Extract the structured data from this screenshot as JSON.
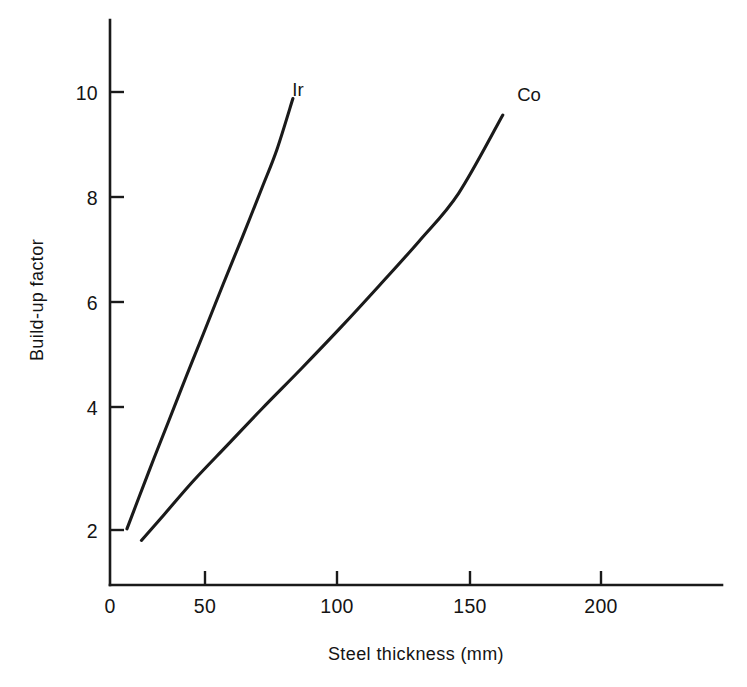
{
  "chart_data": {
    "type": "line",
    "title": "",
    "subtitle": "",
    "xlabel": "Steel thickness (mm)",
    "ylabel": "Build-up factor",
    "xlim": [
      0,
      234
    ],
    "ylim": [
      0,
      11.1
    ],
    "xticks": [
      0,
      50,
      100,
      150,
      200
    ],
    "xticklabels": [
      "0",
      "50",
      "100",
      "150",
      "200"
    ],
    "yticks": [
      2,
      4,
      6,
      8,
      10
    ],
    "yticklabels": [
      "2",
      "4",
      "6",
      "8",
      "10"
    ],
    "grid": false,
    "legend": "inline-curve-labels",
    "annotations": [
      {
        "text": "Ir",
        "x": 74,
        "y": 10.45
      },
      {
        "text": "Co",
        "x": 158,
        "y": 10.05
      }
    ],
    "series": [
      {
        "name": "Ir",
        "label": "Ir",
        "color": "#1a1a1a",
        "x": [
          6.9,
          12.0,
          18.0,
          24.0,
          31.0,
          38.0,
          46.0,
          54.0,
          62.0,
          68.0,
          74.5
        ],
        "y": [
          2.02,
          2.62,
          3.32,
          4.0,
          4.8,
          5.58,
          6.48,
          7.36,
          8.26,
          8.95,
          9.88
        ]
      },
      {
        "name": "Co",
        "label": "Co",
        "color": "#1a1a1a",
        "x": [
          12.8,
          22.0,
          34.0,
          48.0,
          62.0,
          78.0,
          94.0,
          110.0,
          126.0,
          142.0,
          160.0
        ],
        "y": [
          1.81,
          2.28,
          2.9,
          3.56,
          4.22,
          4.95,
          5.7,
          6.48,
          7.28,
          8.15,
          9.58
        ]
      }
    ]
  },
  "figure": {
    "background_color": "#ffffff",
    "line_color": "#1a1a1a"
  }
}
